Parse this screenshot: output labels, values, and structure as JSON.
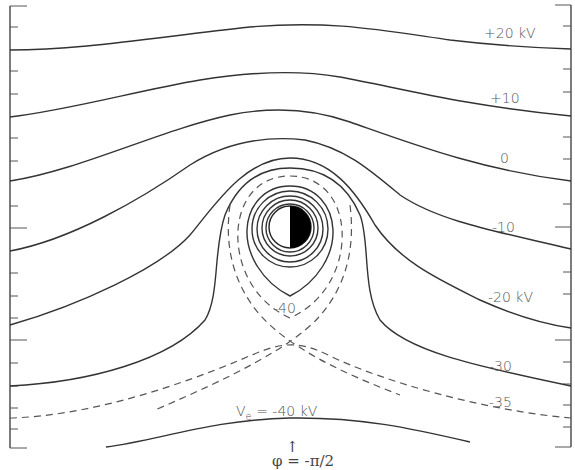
{
  "figure": {
    "contour_labels": {
      "plus20": "+20 kV",
      "plus10": "+10",
      "zero": "0",
      "minus10": "-10",
      "minus20": "-20 kV",
      "minus30": "-30",
      "minus35": "-35",
      "minus40": "-40"
    },
    "bottom_label": {
      "v": "V",
      "sub": "e",
      "rest": " = -40 kV"
    },
    "annotation": {
      "arrow": "↑",
      "phi": "φ = -π/2"
    },
    "body": {
      "description": "half-lit spherical body (planet/moon) at center",
      "dark_half": "right",
      "dark_color": "#000000"
    },
    "contours": [
      {
        "value_kV": 20,
        "style": "solid"
      },
      {
        "value_kV": 10,
        "style": "solid"
      },
      {
        "value_kV": 0,
        "style": "solid"
      },
      {
        "value_kV": -10,
        "style": "solid"
      },
      {
        "value_kV": -20,
        "style": "solid"
      },
      {
        "value_kV": -30,
        "style": "solid"
      },
      {
        "value_kV": -35,
        "style": "dashed"
      },
      {
        "value_kV": -40,
        "style": "dashed separatrix"
      }
    ]
  }
}
